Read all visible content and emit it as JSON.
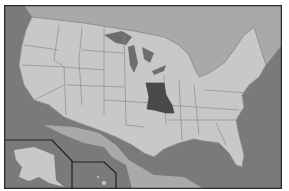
{
  "map": {
    "subject": "United States",
    "highlighted_state": "Missouri",
    "insets": [
      "Alaska",
      "Hawaii"
    ],
    "colors": {
      "background": "#ffffff",
      "border_frame": "#2a2a2a",
      "ocean": "#7a7a7a",
      "canada_mexico": "#a9a9a9",
      "states": "#c8c8c8",
      "state_lines": "#8c8c8c",
      "highlight": "#4a4a4a",
      "lakes": "#6e6e6e"
    }
  }
}
